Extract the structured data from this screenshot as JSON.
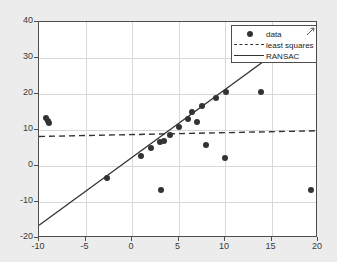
{
  "chart_data": {
    "type": "scatter",
    "title": "",
    "xlabel": "",
    "ylabel": "",
    "xlim": [
      -10,
      20
    ],
    "ylim": [
      -20,
      40
    ],
    "xticks": [
      -10,
      -5,
      0,
      5,
      10,
      15,
      20
    ],
    "yticks": [
      -20,
      -10,
      0,
      10,
      20,
      30,
      40
    ],
    "grid": true,
    "legend_position": "upper right",
    "legend": [
      "data",
      "least squares",
      "RANSAC"
    ],
    "series": [
      {
        "name": "data",
        "type": "scatter",
        "marker": "circle",
        "color": "#333333",
        "points": [
          [
            -9.2,
            13.4
          ],
          [
            -9.0,
            12.6
          ],
          [
            -8.9,
            12.0
          ],
          [
            -2.7,
            -3.3
          ],
          [
            1.0,
            2.8
          ],
          [
            2.0,
            5.0
          ],
          [
            3.0,
            6.6
          ],
          [
            3.1,
            -6.7
          ],
          [
            3.4,
            6.9
          ],
          [
            4.1,
            8.6
          ],
          [
            5.0,
            10.7
          ],
          [
            6.0,
            13.1
          ],
          [
            6.5,
            15.1
          ],
          [
            7.0,
            12.1
          ],
          [
            7.5,
            16.8
          ],
          [
            8.0,
            5.8
          ],
          [
            9.0,
            18.9
          ],
          [
            10.0,
            2.2
          ],
          [
            10.1,
            20.6
          ],
          [
            13.9,
            20.5
          ],
          [
            19.2,
            -6.8
          ]
        ]
      },
      {
        "name": "least squares",
        "type": "line",
        "style": "dashed",
        "color": "#333333",
        "endpoints": [
          [
            -10,
            7.9
          ],
          [
            20,
            9.5
          ]
        ]
      },
      {
        "name": "RANSAC",
        "type": "line",
        "style": "solid",
        "color": "#333333",
        "endpoints": [
          [
            -10,
            -17.0
          ],
          [
            15.2,
            30.6
          ]
        ]
      }
    ]
  },
  "axes": {
    "xtick_labels": [
      "-10",
      "-5",
      "0",
      "5",
      "10",
      "15",
      "20"
    ],
    "ytick_labels": [
      "40",
      "30",
      "20",
      "10",
      "0",
      "-10",
      "-20"
    ]
  },
  "legend": {
    "items": [
      {
        "label": "data",
        "symbol": "marker-dot"
      },
      {
        "label": "least squares",
        "symbol": "dashed-line"
      },
      {
        "label": "RANSAC",
        "symbol": "solid-line"
      }
    ]
  },
  "colors": {
    "figure_background": "#ececec",
    "axes_background": "#ffffff",
    "grid": "#d8d8d8",
    "axis_line": "#4d4d4d",
    "data": "#333333"
  }
}
